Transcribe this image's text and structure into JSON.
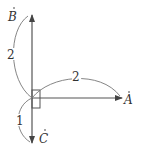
{
  "diagram": {
    "points": [
      {
        "id": "A",
        "label": "A",
        "x": 130,
        "y": 104
      },
      {
        "id": "B",
        "label": "B",
        "x": 13,
        "y": 20
      },
      {
        "id": "C",
        "label": "C",
        "x": 42,
        "y": 142
      }
    ],
    "origin": {
      "x": 32,
      "y": 98
    },
    "vectors": [
      {
        "to": "A",
        "length_label": "2"
      },
      {
        "to": "B",
        "length_label": "2"
      },
      {
        "to": "C",
        "length_label": "1"
      }
    ],
    "arc_labels": {
      "OA": "2",
      "OB": "2",
      "OC": "1"
    },
    "right_angle_marker": true,
    "colors": {
      "line": "#555555",
      "text": "#333333"
    }
  }
}
